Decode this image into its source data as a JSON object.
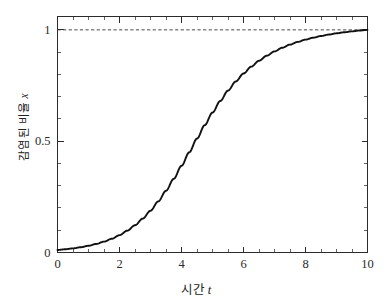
{
  "chart_data": {
    "type": "line",
    "title": "",
    "subtitle": "",
    "xlabel_korean": "시간",
    "xlabel_var": "t",
    "xlabel_full": "시간 t",
    "ylabel_korean": "감염된 비율",
    "ylabel_var": "x",
    "ylabel_full": "감염된 비율 x",
    "xlim": [
      0,
      10
    ],
    "ylim": [
      0,
      1.06
    ],
    "grid": false,
    "legend": "none",
    "curve_color": "#111111",
    "asymptote_color": "#333333",
    "axis_color": "#2b2b2b",
    "xticks": [
      {
        "value": 0,
        "label": "0"
      },
      {
        "value": 2,
        "label": "2"
      },
      {
        "value": 4,
        "label": "4"
      },
      {
        "value": 6,
        "label": "6"
      },
      {
        "value": 8,
        "label": "8"
      },
      {
        "value": 10,
        "label": "10"
      }
    ],
    "yticks": [
      {
        "value": 0,
        "label": "0"
      },
      {
        "value": 0.5,
        "label": "0.5"
      },
      {
        "value": 1,
        "label": "1"
      }
    ],
    "x_minor_step": 0.5,
    "y_minor_step": 0.1,
    "annotations": [
      {
        "kind": "hline",
        "y": 1,
        "style": "dashed",
        "label": ""
      }
    ],
    "series": [
      {
        "name": "logistic",
        "style": "solid",
        "x": [
          0,
          0.25,
          0.5,
          0.75,
          1,
          1.25,
          1.5,
          1.75,
          2,
          2.25,
          2.5,
          2.75,
          3,
          3.25,
          3.5,
          3.75,
          4,
          4.25,
          4.5,
          4.75,
          5,
          5.25,
          5.5,
          5.75,
          6,
          6.25,
          6.5,
          6.75,
          7,
          7.25,
          7.5,
          7.75,
          8,
          8.25,
          8.5,
          8.75,
          9,
          9.25,
          9.5,
          9.75,
          10
        ],
        "y": [
          0.0101,
          0.0129,
          0.0165,
          0.0211,
          0.0268,
          0.0341,
          0.0433,
          0.0548,
          0.0692,
          0.0869,
          0.1087,
          0.1351,
          0.1666,
          0.2036,
          0.2462,
          0.2938,
          0.3455,
          0.3995,
          0.4543,
          0.5078,
          0.558,
          0.6041,
          0.6455,
          0.6819,
          0.7136,
          0.7411,
          0.7646,
          0.7847,
          0.8019,
          0.8165,
          0.829,
          0.8397,
          0.8488,
          0.8566,
          0.8633,
          0.869,
          0.874,
          0.8782,
          0.8819,
          0.8851,
          0.8878
        ]
      }
    ],
    "curve_description": "logistic / sigmoid growth curve rising from near 0 to asymptote 1, midpoint near t = 4.7"
  },
  "axes": {
    "x_axis_name": "time-axis",
    "y_axis_name": "infected-fraction-axis"
  }
}
